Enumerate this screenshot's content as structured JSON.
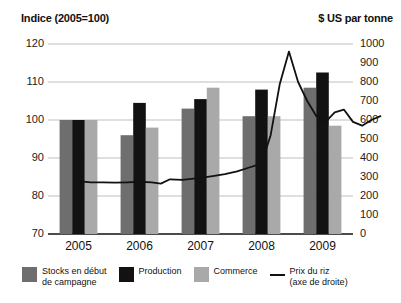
{
  "header": {
    "left_axis_title": "Indice (2005=100)",
    "right_axis_title": "$ US par tonne"
  },
  "legend": {
    "items": [
      {
        "label": "Stocks en début\nde campagne",
        "color": "#6e6e6e",
        "type": "swatch",
        "icon": "square-swatch-icon"
      },
      {
        "label": "Production",
        "color": "#121212",
        "type": "swatch",
        "icon": "square-swatch-icon"
      },
      {
        "label": "Commerce",
        "color": "#a9a9a9",
        "type": "swatch",
        "icon": "square-swatch-icon"
      },
      {
        "label": "Prix du riz\n(axe de droite)",
        "color": "#111111",
        "type": "line",
        "icon": "line-swatch-icon"
      }
    ]
  },
  "chart_data": {
    "type": "bar",
    "title": "",
    "subtitle": "",
    "categories": [
      "2005",
      "2006",
      "2007",
      "2008",
      "2009"
    ],
    "xlabel": "",
    "ylabel": "Indice (2005=100)",
    "ylabel_right": "$ US par tonne",
    "ylim": [
      70,
      120
    ],
    "yticks": [
      70,
      80,
      90,
      100,
      110,
      120
    ],
    "ylim_right": [
      0,
      1000
    ],
    "yticks_right": [
      0,
      100,
      200,
      300,
      400,
      500,
      600,
      700,
      800,
      900,
      1000
    ],
    "grid": true,
    "legend_position": "bottom",
    "series": [
      {
        "name": "Stocks en début de campagne",
        "color": "#6e6e6e",
        "type": "bar",
        "axis": "left",
        "values": [
          100,
          96,
          103,
          101,
          108.5
        ]
      },
      {
        "name": "Production",
        "color": "#121212",
        "type": "bar",
        "axis": "left",
        "values": [
          100,
          104.5,
          105.5,
          108,
          112.5
        ]
      },
      {
        "name": "Commerce",
        "color": "#a9a9a9",
        "type": "bar",
        "axis": "left",
        "values": [
          100,
          98,
          108.5,
          101,
          98.5
        ]
      },
      {
        "name": "Prix du riz (axe de droite)",
        "color": "#111111",
        "type": "line",
        "axis": "right",
        "x": [
          2005.0,
          2005.2,
          2005.4,
          2005.6,
          2005.8,
          2006.0,
          2006.2,
          2006.35,
          2006.5,
          2006.7,
          2006.85,
          2007.0,
          2007.2,
          2007.4,
          2007.6,
          2007.8,
          2008.0,
          2008.15,
          2008.3,
          2008.45,
          2008.6,
          2008.75,
          2008.9,
          2009.05,
          2009.2,
          2009.35,
          2009.5,
          2009.65,
          2009.8,
          2009.95
        ],
        "values": [
          278,
          272,
          272,
          270,
          272,
          275,
          272,
          265,
          288,
          285,
          290,
          295,
          305,
          315,
          330,
          350,
          370,
          520,
          790,
          960,
          800,
          700,
          620,
          590,
          640,
          655,
          590,
          570,
          600,
          620
        ]
      }
    ]
  }
}
